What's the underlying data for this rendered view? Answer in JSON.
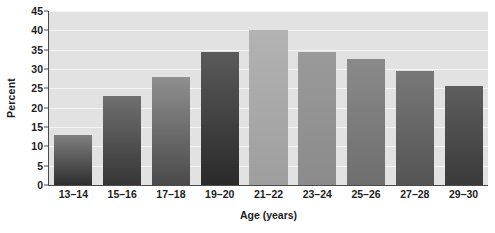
{
  "chart_data": {
    "type": "bar",
    "title": "",
    "subtitle": "",
    "xlabel": "Age (years)",
    "ylabel": "Percent",
    "categories": [
      "13–14",
      "15–16",
      "17–18",
      "19–20",
      "21–22",
      "23–24",
      "25–26",
      "27–28",
      "29–30"
    ],
    "values": [
      13,
      23,
      28,
      34.5,
      40,
      34.5,
      32.5,
      29.5,
      25.5
    ],
    "ylim": [
      0,
      45
    ],
    "ytick_labels": [
      "0",
      "5",
      "10",
      "15",
      "20",
      "25",
      "30",
      "35",
      "40",
      "45"
    ],
    "ytick_values": [
      0,
      5,
      10,
      15,
      20,
      25,
      30,
      35,
      40,
      45
    ],
    "ytick_step": 5,
    "grid": true,
    "grid_color": "#f4f4f4",
    "legend": "none",
    "plot_background": "#e2e2e2",
    "axis_color": "#4a4a4a",
    "bar_colors_top": [
      "#7f7f7f",
      "#6f6f6f",
      "#8f8f8f",
      "#5a5a5a",
      "#b3b3b3",
      "#9a9a9a",
      "#8a8a8a",
      "#787878",
      "#5e5e5e"
    ],
    "bar_colors_bottom": [
      "#2f2f2f",
      "#363636",
      "#4a4a4a",
      "#2a2a2a",
      "#9e9e9e",
      "#8b8b8b",
      "#6e6e6e",
      "#545454",
      "#3a3a3a"
    ],
    "bar_gap_ratio": 0.22
  }
}
